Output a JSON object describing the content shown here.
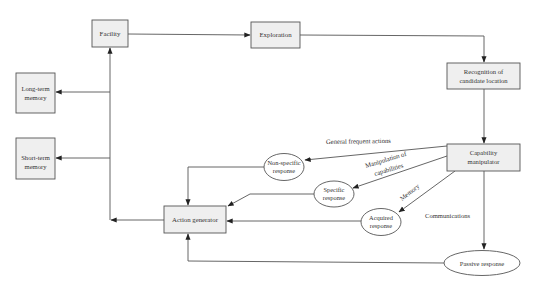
{
  "diagram": {
    "colors": {
      "box_fill": "#efefef",
      "stroke": "#555555",
      "text": "#333333",
      "background": "#ffffff"
    },
    "boxes": [
      {
        "id": "facility",
        "lines": [
          "Facility"
        ]
      },
      {
        "id": "exploration",
        "lines": [
          "Exploration"
        ]
      },
      {
        "id": "recognition",
        "lines": [
          "Recognition of",
          "candidate location"
        ]
      },
      {
        "id": "long_term",
        "lines": [
          "Long-term",
          "memory"
        ]
      },
      {
        "id": "short_term",
        "lines": [
          "Short-term",
          "memory"
        ]
      },
      {
        "id": "capability",
        "lines": [
          "Capability",
          "manipulator"
        ]
      },
      {
        "id": "action",
        "lines": [
          "Action generator"
        ]
      }
    ],
    "ellipses": [
      {
        "id": "nonspecific",
        "lines": [
          "Non-specific",
          "response"
        ]
      },
      {
        "id": "specific",
        "lines": [
          "Specific",
          "response"
        ]
      },
      {
        "id": "acquired",
        "lines": [
          "Acquired",
          "response"
        ]
      },
      {
        "id": "passive",
        "lines": [
          "Passive response"
        ]
      }
    ],
    "edge_labels": {
      "general": "General frequent actions",
      "manip1": "Manipulation of",
      "manip2": "capabilities",
      "memory": "Memory",
      "communications": "Communications"
    },
    "edges": [
      {
        "from": "facility",
        "to": "exploration"
      },
      {
        "from": "exploration",
        "to": "recognition"
      },
      {
        "from": "recognition",
        "to": "capability"
      },
      {
        "from": "capability",
        "to": "nonspecific",
        "label": "General frequent actions"
      },
      {
        "from": "capability",
        "to": "specific",
        "label": "Manipulation of capabilities"
      },
      {
        "from": "capability",
        "to": "acquired",
        "label": "Memory"
      },
      {
        "from": "capability",
        "to": "passive",
        "label": "Communications"
      },
      {
        "from": "nonspecific",
        "to": "action"
      },
      {
        "from": "specific",
        "to": "action"
      },
      {
        "from": "acquired",
        "to": "action"
      },
      {
        "from": "passive",
        "to": "action"
      },
      {
        "from": "action",
        "to": "trunk"
      },
      {
        "from": "trunk",
        "to": "facility"
      },
      {
        "from": "trunk",
        "to": "long_term"
      },
      {
        "from": "trunk",
        "to": "short_term"
      }
    ]
  }
}
